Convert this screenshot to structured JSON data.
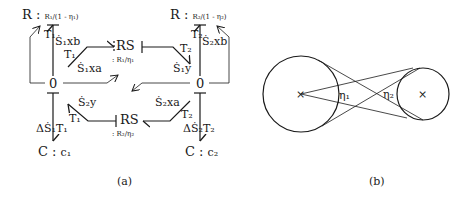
{
  "figure": {
    "panel_a": {
      "caption": "(a)",
      "resistors": {
        "top_left": {
          "prefix": "R : ",
          "param": "R₁/(1 - η₁)"
        },
        "top_right": {
          "prefix": "R : ",
          "param": "R₂/(1 - η₂)"
        }
      },
      "rs_elements": {
        "upper": {
          "label": "RS",
          "param": ": R₁/η₁"
        },
        "lower": {
          "label": "RS",
          "param": ": R₂/η₂"
        }
      },
      "junctions": {
        "left": "0",
        "right": "0"
      },
      "capacitors": {
        "left": {
          "prefix": "C : ",
          "param": "c₁"
        },
        "right": {
          "prefix": "C : ",
          "param": "c₂"
        }
      },
      "bond_labels": {
        "T1_S1xb": {
          "effort": "T₁",
          "flow": "Ṡ₁xb"
        },
        "T1_S1xa": {
          "effort": "T₁",
          "flow": "Ṡ₁xa"
        },
        "T2_S1y": {
          "effort": "T₂",
          "flow": "Ṡ₁y"
        },
        "T2_S2xb": {
          "effort": "T₂",
          "flow": "Ṡ₂xb"
        },
        "T1_S2y": {
          "effort": "T₁",
          "flow": "Ṡ₂y"
        },
        "T2_S2xa": {
          "effort": "T₂",
          "flow": "Ṡ₂xa"
        },
        "dS1_T1": {
          "flow": "ΔṠ₁",
          "effort": "T₁"
        },
        "dS2_T2": {
          "flow": "ΔṠ₂",
          "effort": "T₂"
        }
      }
    },
    "panel_b": {
      "caption": "(b)",
      "angle_labels": {
        "left": "η₁",
        "right": "η₂"
      },
      "center_marker": "×"
    }
  }
}
